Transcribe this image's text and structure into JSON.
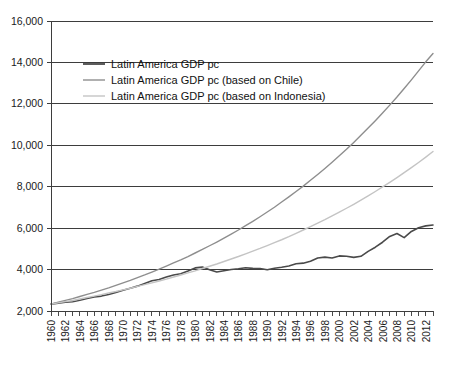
{
  "chart_data": {
    "type": "line",
    "title": "",
    "subtitle": "",
    "xlabel": "",
    "ylabel": "",
    "xlim": [
      1960,
      2013
    ],
    "ylim": [
      2000,
      16000
    ],
    "grid": true,
    "legend_position": "top-left",
    "y_ticks": [
      2000,
      4000,
      6000,
      8000,
      10000,
      12000,
      14000,
      16000
    ],
    "y_tick_labels": [
      "2,000",
      "4,000",
      "6,000",
      "8,000",
      "10,000",
      "12,000",
      "14,000",
      "16,000"
    ],
    "x_ticks": [
      1960,
      1961,
      1962,
      1963,
      1964,
      1965,
      1966,
      1967,
      1968,
      1969,
      1970,
      1971,
      1972,
      1973,
      1974,
      1975,
      1976,
      1977,
      1978,
      1979,
      1980,
      1981,
      1982,
      1983,
      1984,
      1985,
      1986,
      1987,
      1988,
      1989,
      1990,
      1991,
      1992,
      1993,
      1994,
      1995,
      1996,
      1997,
      1998,
      1999,
      2000,
      2001,
      2002,
      2003,
      2004,
      2005,
      2006,
      2007,
      2008,
      2009,
      2010,
      2011,
      2012,
      2013
    ],
    "x_tick_labels": [
      "1960",
      "1962",
      "1964",
      "1966",
      "1968",
      "1970",
      "1972",
      "1974",
      "1976",
      "1978",
      "1980",
      "1982",
      "1984",
      "1986",
      "1988",
      "1990",
      "1992",
      "1994",
      "1996",
      "1998",
      "2000",
      "2002",
      "2004",
      "2006",
      "2008",
      "2010",
      "2012"
    ],
    "x_tick_label_years": [
      1960,
      1962,
      1964,
      1966,
      1968,
      1970,
      1972,
      1974,
      1976,
      1978,
      1980,
      1982,
      1984,
      1986,
      1988,
      1990,
      1992,
      1994,
      1996,
      1998,
      2000,
      2002,
      2004,
      2006,
      2008,
      2010,
      2012
    ],
    "x": [
      1960,
      1961,
      1962,
      1963,
      1964,
      1965,
      1966,
      1967,
      1968,
      1969,
      1970,
      1971,
      1972,
      1973,
      1974,
      1975,
      1976,
      1977,
      1978,
      1979,
      1980,
      1981,
      1982,
      1983,
      1984,
      1985,
      1986,
      1987,
      1988,
      1989,
      1990,
      1991,
      1992,
      1993,
      1994,
      1995,
      1996,
      1997,
      1998,
      1999,
      2000,
      2001,
      2002,
      2003,
      2004,
      2005,
      2006,
      2007,
      2008,
      2009,
      2010,
      2011,
      2012,
      2013
    ],
    "series": [
      {
        "name": "Latin America GDP pc",
        "color": "#4a4a4a",
        "width": 1.6,
        "values": [
          2330,
          2380,
          2420,
          2450,
          2520,
          2600,
          2680,
          2720,
          2800,
          2900,
          3000,
          3100,
          3200,
          3330,
          3460,
          3520,
          3640,
          3740,
          3800,
          3930,
          4080,
          4120,
          3990,
          3880,
          3940,
          4000,
          4040,
          4090,
          4060,
          4050,
          3990,
          4060,
          4110,
          4170,
          4280,
          4310,
          4400,
          4560,
          4600,
          4560,
          4660,
          4640,
          4590,
          4640,
          4880,
          5080,
          5320,
          5600,
          5740,
          5540,
          5840,
          6020,
          6110,
          6150
        ]
      },
      {
        "name": "Latin America GDP pc (based on Chile)",
        "color": "#8e8e8e",
        "width": 1.4,
        "values": [
          2330,
          2420,
          2510,
          2600,
          2700,
          2800,
          2900,
          3010,
          3120,
          3240,
          3360,
          3480,
          3610,
          3740,
          3880,
          4020,
          4170,
          4320,
          4470,
          4630,
          4800,
          4970,
          5150,
          5330,
          5520,
          5710,
          5910,
          6120,
          6330,
          6550,
          6780,
          7010,
          7260,
          7510,
          7770,
          8030,
          8310,
          8590,
          8880,
          9180,
          9490,
          9810,
          10140,
          10480,
          10830,
          11190,
          11560,
          11940,
          12330,
          12740,
          13160,
          13590,
          14030,
          14430
        ]
      },
      {
        "name": "Latin America GDP pc (based on Indonesia)",
        "color": "#c4c4c4",
        "width": 1.4,
        "values": [
          2330,
          2390,
          2450,
          2510,
          2580,
          2650,
          2720,
          2790,
          2870,
          2940,
          3020,
          3100,
          3190,
          3270,
          3360,
          3450,
          3540,
          3640,
          3740,
          3840,
          3940,
          4050,
          4160,
          4270,
          4390,
          4510,
          4630,
          4760,
          4890,
          5020,
          5160,
          5300,
          5440,
          5590,
          5750,
          5910,
          6070,
          6240,
          6410,
          6590,
          6770,
          6960,
          7150,
          7350,
          7560,
          7770,
          7990,
          8210,
          8440,
          8680,
          8920,
          9170,
          9430,
          9700
        ]
      }
    ],
    "legend_entries": [
      {
        "label": "Latin America GDP pc",
        "color": "#4a4a4a"
      },
      {
        "label": "Latin America GDP pc (based on Chile)",
        "color": "#8e8e8e"
      },
      {
        "label": "Latin America GDP pc (based on Indonesia)",
        "color": "#c4c4c4"
      }
    ]
  },
  "colors": {
    "background": "#ffffff",
    "axis": "#3d3d3d",
    "grid": "#3d3d3d",
    "text": "#1a1a1a"
  }
}
